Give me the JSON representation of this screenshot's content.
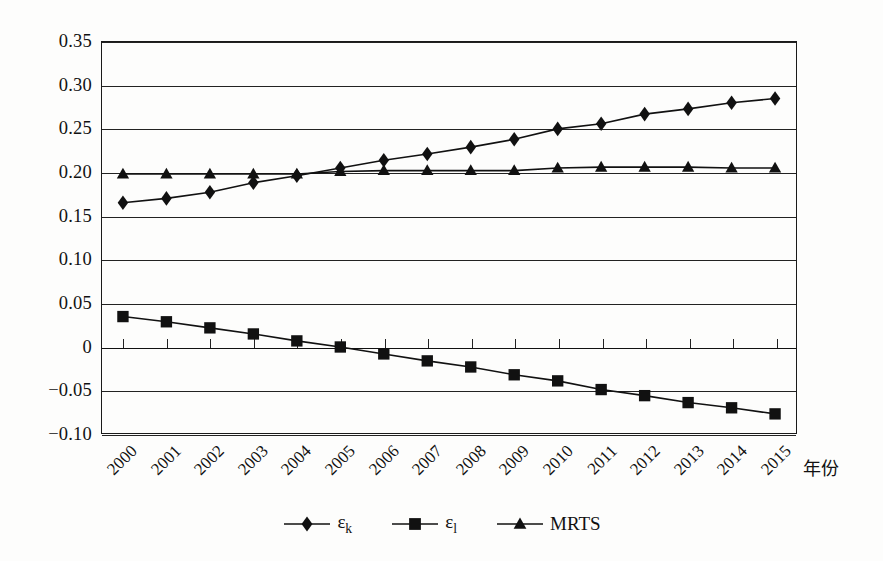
{
  "chart_data": {
    "type": "line",
    "title": "",
    "xlabel": "年份",
    "ylabel": "",
    "x": [
      "2000",
      "2001",
      "2002",
      "2003",
      "2004",
      "2005",
      "2006",
      "2007",
      "2008",
      "2009",
      "2010",
      "2011",
      "2012",
      "2013",
      "2014",
      "2015"
    ],
    "categories": [
      "2000",
      "2001",
      "2002",
      "2003",
      "2004",
      "2005",
      "2006",
      "2007",
      "2008",
      "2009",
      "2010",
      "2011",
      "2012",
      "2013",
      "2014",
      "2015"
    ],
    "ylim": [
      -0.1,
      0.35
    ],
    "yticks": [
      0.35,
      0.3,
      0.25,
      0.2,
      0.15,
      0.1,
      0.05,
      0,
      -0.05,
      -0.1
    ],
    "ytick_labels": [
      "0.35",
      "0.30",
      "0.25",
      "0.20",
      "0.15",
      "0.10",
      "0.05",
      "0",
      "−0.05",
      "−0.10"
    ],
    "grid": true,
    "legend_position": "bottom",
    "series": [
      {
        "name": "εk",
        "label_main": "ε",
        "label_sub": "k",
        "marker": "diamond",
        "color": "#111111",
        "values": [
          0.165,
          0.17,
          0.177,
          0.188,
          0.196,
          0.205,
          0.214,
          0.221,
          0.229,
          0.238,
          0.25,
          0.256,
          0.267,
          0.273,
          0.28,
          0.285
        ]
      },
      {
        "name": "εl",
        "label_main": "ε",
        "label_sub": "l",
        "marker": "square",
        "color": "#111111",
        "values": [
          0.034,
          0.028,
          0.021,
          0.014,
          0.006,
          -0.001,
          -0.009,
          -0.017,
          -0.024,
          -0.033,
          -0.04,
          -0.05,
          -0.057,
          -0.065,
          -0.071,
          -0.078
        ]
      },
      {
        "name": "MRTS",
        "label_main": "MRTS",
        "label_sub": "",
        "marker": "triangle",
        "color": "#111111",
        "values": [
          0.198,
          0.198,
          0.198,
          0.198,
          0.198,
          0.201,
          0.202,
          0.202,
          0.202,
          0.202,
          0.205,
          0.206,
          0.206,
          0.206,
          0.205,
          0.205
        ]
      }
    ]
  },
  "legend": {
    "items": [
      {
        "label": "ε",
        "sub": "k",
        "marker": "diamond"
      },
      {
        "label": "ε",
        "sub": "l",
        "marker": "square"
      },
      {
        "label": "MRTS",
        "sub": "",
        "marker": "triangle"
      }
    ]
  },
  "axis": {
    "x_title": "年份"
  }
}
